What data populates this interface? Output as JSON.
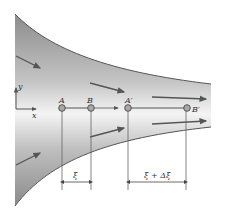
{
  "diagram": {
    "type": "converging-flow-channel",
    "colors": {
      "fluid_edge": "#8a8a8a",
      "fluid_center": "#f2f2f2",
      "boundary": "#555555",
      "arrow": "#555555",
      "point_fill": "#a8a8a8",
      "point_stroke": "#555555",
      "line": "#555555"
    },
    "axes": {
      "x_label": "x",
      "y_label": "y"
    },
    "points": [
      {
        "id": "A",
        "label": "A",
        "x": 62,
        "y": 108
      },
      {
        "id": "B",
        "label": "B",
        "x": 91,
        "y": 108
      },
      {
        "id": "A_prime",
        "label": "A′",
        "x": 128,
        "y": 108
      },
      {
        "id": "B_prime",
        "label": "B′",
        "x": 187,
        "y": 108
      }
    ],
    "dimensions": [
      {
        "id": "xi",
        "label": "ξ",
        "from": "A",
        "to": "B"
      },
      {
        "id": "xi_plus_delta",
        "label": "ξ + Δξ",
        "from": "A_prime",
        "to": "B_prime"
      }
    ]
  }
}
